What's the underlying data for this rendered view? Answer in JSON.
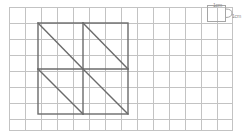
{
  "page": {
    "background_color": "#ffffff",
    "width": 247,
    "height": 138
  },
  "grid": {
    "name": "centimetre-square-grid",
    "columns": 14,
    "rows": 8,
    "cell_size_px": 16,
    "cell_size_label": "1cm",
    "line_color": "#c3c3c3",
    "fill_color": "#ffffff",
    "origin_x": 9,
    "origin_y": 7,
    "width_px": 224,
    "height_px": 124
  },
  "figure": {
    "name": "square-divided-into-four-triangle-pairs",
    "shape": "square",
    "stroke_color": "#6b6b6b",
    "outline": {
      "left": 38,
      "top": 23,
      "right": 128,
      "bottom": 114,
      "side_cells": 5.6
    },
    "divider_vertical_x": 83,
    "divider_horizontal_y": 69,
    "quadrants": [
      {
        "name": "top-left",
        "diagonal": "top-left-to-bottom-right"
      },
      {
        "name": "top-right",
        "diagonal": "top-left-to-bottom-right"
      },
      {
        "name": "bottom-left",
        "diagonal": "top-left-to-bottom-right"
      },
      {
        "name": "bottom-right",
        "diagonal": "top-left-to-bottom-right"
      }
    ],
    "diagonal_count": 4
  },
  "annotations": {
    "scale": {
      "name": "grid-scale-key",
      "marker_color": "#9a9a9a",
      "label_top": "1cm",
      "label_side": "1cm"
    }
  }
}
